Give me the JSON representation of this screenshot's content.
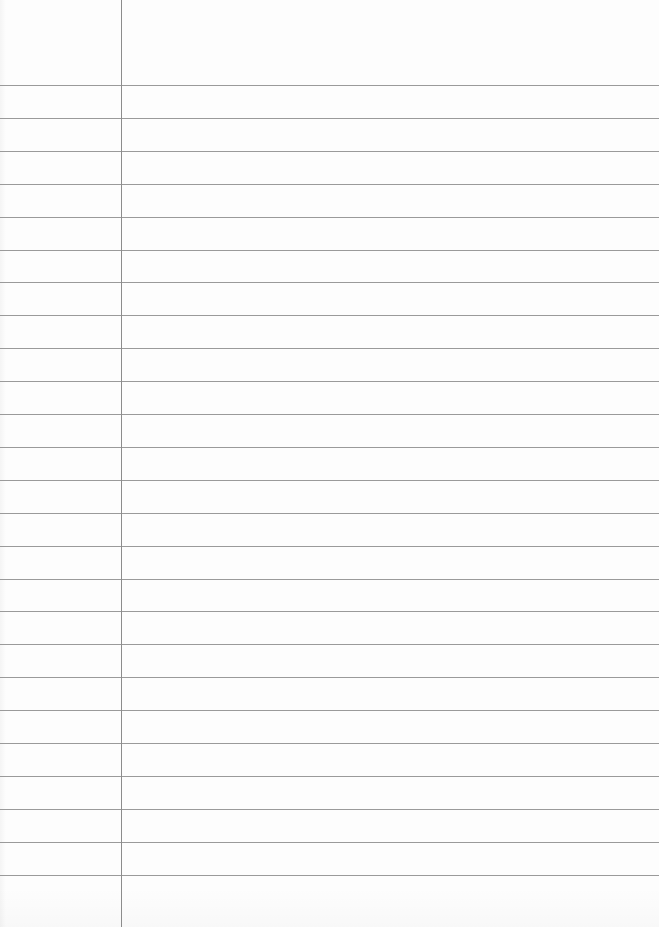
{
  "paper": {
    "width": 659,
    "height": 927,
    "background_color": "#fdfdfd",
    "rule_color": "#9a9a9a",
    "margin_line_color": "#8c8c8c",
    "margin_line_x": 121,
    "first_rule_y": 85,
    "rule_spacing": 32.9,
    "rule_count": 25
  }
}
